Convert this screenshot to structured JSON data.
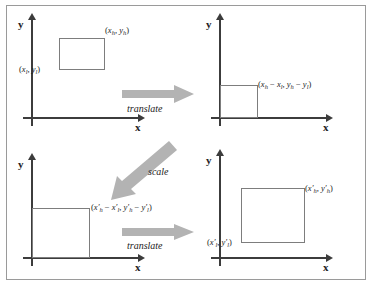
{
  "figure": {
    "type": "diagram",
    "colors": {
      "axis": "#3c3c3c",
      "rectangle_stroke": "#7d7d7d",
      "arrow_fill": "#b3b3b3",
      "frame_border": "#9a9a9a",
      "text": "#1c1c1c",
      "background": "#ffffff"
    },
    "axis_labels": {
      "y": "y",
      "x": "x"
    },
    "panels": [
      {
        "id": "panel-original",
        "position": "top-left",
        "axis_y_label": "y",
        "axis_x_label": "x",
        "rectangle": {
          "at_origin": false,
          "labels": [
            {
              "id": "upper-right",
              "text": "(x_h, y_h)"
            },
            {
              "id": "lower-left",
              "text": "(x_l, y_l)"
            }
          ]
        }
      },
      {
        "id": "panel-translated",
        "position": "top-right",
        "axis_y_label": "y",
        "axis_x_label": "x",
        "rectangle": {
          "at_origin": true,
          "labels": [
            {
              "id": "upper-right",
              "text": "(x_h − x_l, y_h − y_l)"
            }
          ]
        }
      },
      {
        "id": "panel-scaled",
        "position": "bottom-left",
        "axis_y_label": "y",
        "axis_x_label": "x",
        "rectangle": {
          "at_origin": true,
          "labels": [
            {
              "id": "upper-right",
              "text": "(x'_h − x'_l, y'_h − y'_l)"
            }
          ]
        }
      },
      {
        "id": "panel-final",
        "position": "bottom-right",
        "axis_y_label": "y",
        "axis_x_label": "x",
        "rectangle": {
          "at_origin": false,
          "labels": [
            {
              "id": "upper-right",
              "text": "(x'_h, y'_h)"
            },
            {
              "id": "lower-left",
              "text": "(x'_l, y'_l)"
            }
          ]
        }
      }
    ],
    "arrows": [
      {
        "id": "arrow-translate-top",
        "label": "translate",
        "direction": "right"
      },
      {
        "id": "arrow-scale",
        "label": "scale",
        "direction": "down-left"
      },
      {
        "id": "arrow-translate-bottom",
        "label": "translate",
        "direction": "right"
      }
    ]
  }
}
